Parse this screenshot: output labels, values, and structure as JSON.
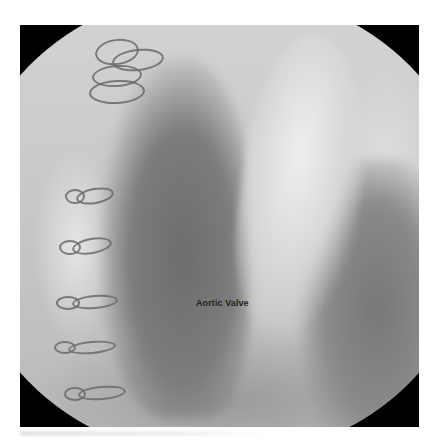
{
  "figure": {
    "type": "fluoroscopy-angiogram",
    "annotations": [
      {
        "text": "Aortic Valve"
      }
    ],
    "features": {
      "sternal_wires": 7,
      "view_mask": "circular field on black square"
    },
    "colors": {
      "background": "#ffffff",
      "mask": "#000000",
      "label_text": "#222222"
    }
  }
}
